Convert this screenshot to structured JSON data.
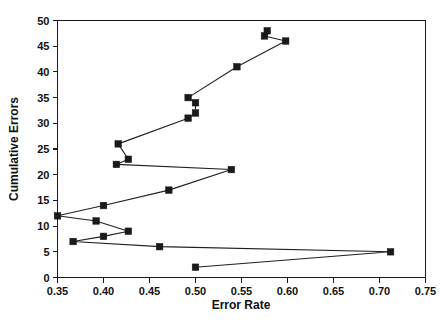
{
  "chart_data": {
    "type": "line",
    "title": "",
    "subtitle": "",
    "xlabel": "Error Rate",
    "ylabel": "Cumulative Errors",
    "xlim": [
      0.35,
      0.75
    ],
    "ylim": [
      0,
      50
    ],
    "xticks": [
      0.35,
      0.4,
      0.45,
      0.5,
      0.55,
      0.6,
      0.65,
      0.7,
      0.75
    ],
    "xtick_labels": [
      "0.35",
      "0.40",
      "0.45",
      "0.50",
      "0.55",
      "0.60",
      "0.65",
      "0.70",
      "0.75"
    ],
    "yticks": [
      0,
      5,
      10,
      15,
      20,
      25,
      30,
      35,
      40,
      45,
      50
    ],
    "ytick_labels": [
      "0",
      "5",
      "10",
      "15",
      "20",
      "25",
      "30",
      "35",
      "40",
      "45",
      "50"
    ],
    "grid": false,
    "legend": false,
    "legend_position": "none",
    "marker": "square",
    "marker_color": "#1a1a1a",
    "line_color": "#1f1f1f",
    "series": [
      {
        "name": "Cumulative Errors vs Error Rate",
        "points": [
          {
            "x": 0.5,
            "y": 2
          },
          {
            "x": 0.712,
            "y": 5
          },
          {
            "x": 0.461,
            "y": 6
          },
          {
            "x": 0.367,
            "y": 7
          },
          {
            "x": 0.4,
            "y": 8
          },
          {
            "x": 0.427,
            "y": 9
          },
          {
            "x": 0.392,
            "y": 11
          },
          {
            "x": 0.35,
            "y": 12
          },
          {
            "x": 0.4,
            "y": 14
          },
          {
            "x": 0.471,
            "y": 17
          },
          {
            "x": 0.539,
            "y": 21
          },
          {
            "x": 0.414,
            "y": 22
          },
          {
            "x": 0.427,
            "y": 23
          },
          {
            "x": 0.416,
            "y": 26
          },
          {
            "x": 0.492,
            "y": 31
          },
          {
            "x": 0.5,
            "y": 32
          },
          {
            "x": 0.5,
            "y": 34
          },
          {
            "x": 0.492,
            "y": 35
          },
          {
            "x": 0.545,
            "y": 41
          },
          {
            "x": 0.598,
            "y": 46
          },
          {
            "x": 0.575,
            "y": 47
          },
          {
            "x": 0.578,
            "y": 48
          }
        ]
      }
    ]
  }
}
